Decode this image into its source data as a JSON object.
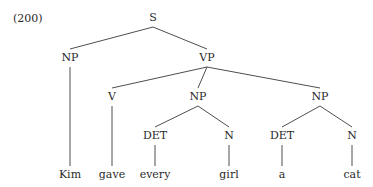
{
  "example_number": "(200)",
  "tree": {
    "nodes": [
      {
        "id": "S",
        "label": "S",
        "type": "phrase"
      },
      {
        "id": "NP1",
        "label": "NP",
        "type": "phrase",
        "parent": "S"
      },
      {
        "id": "VP",
        "label": "VP",
        "type": "phrase",
        "parent": "S"
      },
      {
        "id": "V",
        "label": "V",
        "type": "phrase",
        "parent": "VP"
      },
      {
        "id": "NP2",
        "label": "NP",
        "type": "phrase",
        "parent": "VP"
      },
      {
        "id": "NP3",
        "label": "NP",
        "type": "phrase",
        "parent": "VP"
      },
      {
        "id": "DET1",
        "label": "DET",
        "type": "phrase",
        "parent": "NP2"
      },
      {
        "id": "N1",
        "label": "N",
        "type": "phrase",
        "parent": "NP2"
      },
      {
        "id": "DET2",
        "label": "DET",
        "type": "phrase",
        "parent": "NP3"
      },
      {
        "id": "N2",
        "label": "N",
        "type": "phrase",
        "parent": "NP3"
      },
      {
        "id": "w_kim",
        "label": "Kim",
        "type": "word",
        "parent": "NP1"
      },
      {
        "id": "w_gave",
        "label": "gave",
        "type": "word",
        "parent": "V"
      },
      {
        "id": "w_every",
        "label": "every",
        "type": "word",
        "parent": "DET1"
      },
      {
        "id": "w_girl",
        "label": "girl",
        "type": "word",
        "parent": "N1"
      },
      {
        "id": "w_a",
        "label": "a",
        "type": "word",
        "parent": "DET2"
      },
      {
        "id": "w_cat",
        "label": "cat",
        "type": "word",
        "parent": "N2"
      }
    ]
  }
}
